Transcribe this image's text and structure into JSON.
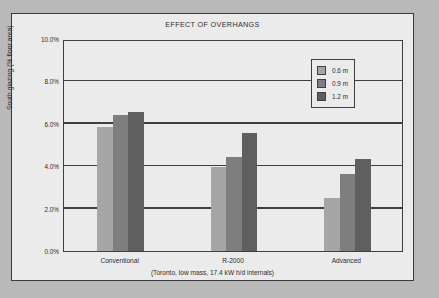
{
  "chart_data": {
    "type": "bar",
    "title": "EFFECT OF OVERHANGS",
    "xlabel": "(Toronto, low mass, 17.4 kW h/d internals)",
    "ylabel": "South glazing (% floor area)",
    "categories": [
      "Conventional",
      "R-2000",
      "Advanced"
    ],
    "series": [
      {
        "name": "0.6 m",
        "color": "#a6a6a6",
        "values": [
          5.85,
          3.98,
          2.48
        ]
      },
      {
        "name": "0.9 m",
        "color": "#7e7e7e",
        "values": [
          6.42,
          4.45,
          3.64
        ]
      },
      {
        "name": "1.2 m",
        "color": "#5f5f5f",
        "values": [
          6.55,
          5.55,
          4.32
        ]
      }
    ],
    "ylim": [
      0.0,
      10.0
    ],
    "ytick_labels": [
      "0.0%",
      "2.0%",
      "4.0%",
      "6.0%",
      "8.0%",
      "10.0%"
    ],
    "ytick_values": [
      0.0,
      2.0,
      4.0,
      6.0,
      8.0,
      10.0
    ],
    "grid": true,
    "legend_position": "upper right"
  },
  "colors": {
    "page_background": "#b9b9b9",
    "card_background": "#ebebeb",
    "frame": "#3f3f3f",
    "text": "#2b2b2b"
  }
}
